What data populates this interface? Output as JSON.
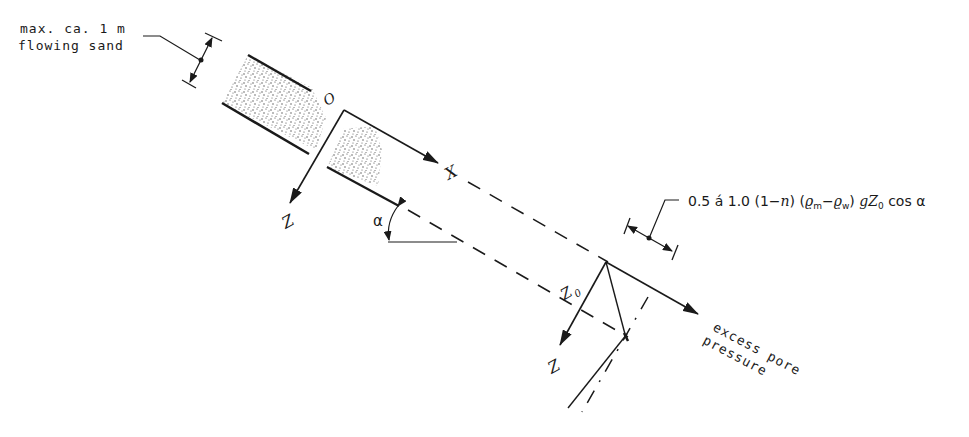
{
  "diagram": {
    "type": "engineering-cross-section",
    "labels": {
      "sand_line1": "max. ca. 1 m",
      "sand_line2": "flowing sand",
      "origin": "O",
      "x_axis": "X",
      "z_axis_top": "Z",
      "z_axis_bottom": "Z",
      "angle": "α",
      "z0": "Z",
      "z0_sub": "0",
      "formula": "0.5 á 1.0 (1−n) (ρm−ρw) gZ0 cos α",
      "formula_parts": {
        "a": "0.5 á 1.0 (1−",
        "n": "n",
        "b": ") (",
        "rho1": "ϱ",
        "m": "m",
        "dash": "−",
        "rho2": "ϱ",
        "w": "w",
        "c": ") ",
        "g": "g",
        "Z": "Z",
        "zero": "0",
        "d": " cos α"
      },
      "excess_line1": "excess pore",
      "excess_line2": "pressure"
    },
    "colors": {
      "ink": "#1a1a1a",
      "background": "#ffffff",
      "sand": "#555555"
    }
  }
}
